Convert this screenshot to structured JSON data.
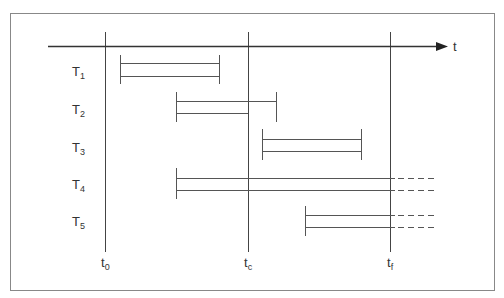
{
  "figure": {
    "frame_color": "#888888",
    "line_color": "#444444",
    "axis": {
      "label": "t",
      "y": 46,
      "x_start": 48,
      "x_end": 447
    },
    "time_markers": [
      {
        "id": "t0",
        "base": "t",
        "sub": "0",
        "x": 105
      },
      {
        "id": "tc",
        "base": "t",
        "sub": "c",
        "x": 248
      },
      {
        "id": "tf",
        "base": "t",
        "sub": "f",
        "x": 390
      }
    ],
    "tasks": [
      {
        "id": "T1",
        "base": "T",
        "sub": "1",
        "label_y": 72,
        "start": 120,
        "end": 219,
        "y1": 63,
        "y2": 76,
        "end_y2": 76,
        "continues": false
      },
      {
        "id": "T2",
        "base": "T",
        "sub": "2",
        "label_y": 110,
        "start": 176,
        "end": 276,
        "y1": 101,
        "y2": 113,
        "end_y2": 248,
        "continues": false,
        "bottom_ends_at": 248
      },
      {
        "id": "T3",
        "base": "T",
        "sub": "3",
        "label_y": 148,
        "start": 262,
        "end": 361,
        "y1": 139,
        "y2": 151,
        "continues": false
      },
      {
        "id": "T4",
        "base": "T",
        "sub": "4",
        "label_y": 187,
        "start": 176,
        "end": 395,
        "y1": 178,
        "y2": 190,
        "continues": true,
        "dash_end": 434
      },
      {
        "id": "T5",
        "base": "T",
        "sub": "5",
        "label_y": 224,
        "start": 305,
        "end": 395,
        "y1": 215,
        "y2": 227,
        "continues": true,
        "dash_end": 434
      }
    ]
  }
}
